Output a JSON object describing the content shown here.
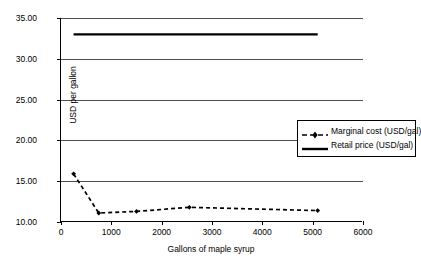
{
  "chart_data": {
    "type": "line",
    "title": "",
    "xlabel": "Gallons of maple syrup",
    "ylabel": "USD per gallon",
    "xlim": [
      0,
      6000
    ],
    "ylim": [
      10,
      35
    ],
    "xticks": [
      "0",
      "1000",
      "2000",
      "3000",
      "4000",
      "5000",
      "6000"
    ],
    "yticks": [
      "10.00",
      "15.00",
      "20.00",
      "25.00",
      "30.00",
      "35.00"
    ],
    "grid": "horizontal",
    "legend_position": "upper-right-inside",
    "series": [
      {
        "name": "Marginal cost (USD/gal)",
        "style": "dashed-with-markers",
        "color": "#000000",
        "x": [
          250,
          750,
          1500,
          2550,
          5100
        ],
        "values": [
          15.9,
          11.1,
          11.3,
          11.8,
          11.4
        ]
      },
      {
        "name": "Retail price (USD/gal)",
        "style": "solid",
        "color": "#000000",
        "x": [
          250,
          5100
        ],
        "values": [
          33.0,
          33.0
        ]
      }
    ]
  },
  "legend": {
    "items": [
      {
        "label": "Marginal cost (USD/gal)",
        "marker": "dashed-diamond-marker-icon"
      },
      {
        "label": "Retail price (USD/gal)",
        "marker": "solid-line-marker-icon"
      }
    ]
  }
}
